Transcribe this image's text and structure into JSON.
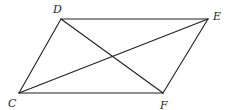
{
  "diagram": {
    "type": "parallelogram-with-diagonals",
    "colors": {
      "stroke": "#231f20",
      "background": "#ffffff"
    },
    "vertices": {
      "D": {
        "label": "D",
        "x": 61,
        "y": 19,
        "label_x": 53,
        "label_y": 13
      },
      "E": {
        "label": "E",
        "x": 208,
        "y": 19,
        "label_x": 213,
        "label_y": 20
      },
      "C": {
        "label": "C",
        "x": 19,
        "y": 93,
        "label_x": 8,
        "label_y": 107
      },
      "F": {
        "label": "F",
        "x": 163,
        "y": 93,
        "label_x": 160,
        "label_y": 109
      }
    },
    "edges": [
      {
        "name": "side-DE",
        "from": "D",
        "to": "E"
      },
      {
        "name": "side-EF",
        "from": "E",
        "to": "F"
      },
      {
        "name": "side-FC",
        "from": "F",
        "to": "C"
      },
      {
        "name": "side-CD",
        "from": "C",
        "to": "D"
      },
      {
        "name": "diagonal-DF",
        "from": "D",
        "to": "F"
      },
      {
        "name": "diagonal-CE",
        "from": "C",
        "to": "E"
      }
    ]
  }
}
